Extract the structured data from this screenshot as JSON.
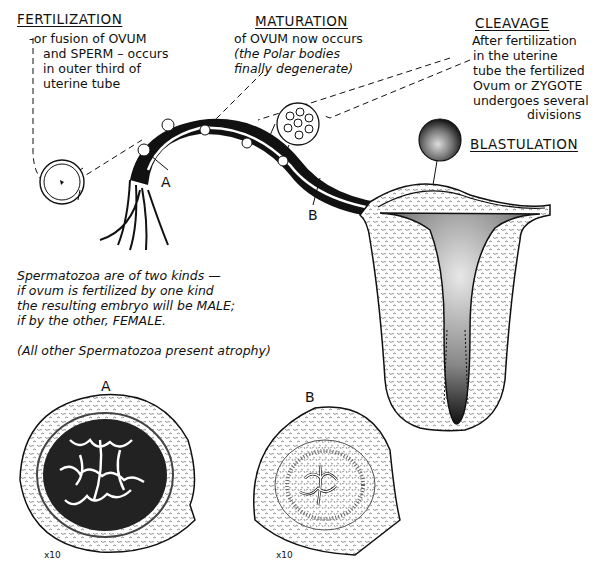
{
  "fertilization": {
    "heading": "FERTILIZATION",
    "lines": [
      "-or fusion of OVUM",
      "and SPERM – occurs",
      "in outer third of",
      "uterine tube"
    ]
  },
  "maturation": {
    "heading": "MATURATION",
    "lines": [
      "of OVUM now occurs"
    ],
    "italic_lines": [
      "(the Polar bodies",
      "finally degenerate)"
    ]
  },
  "cleavage": {
    "heading": "CLEAVAGE",
    "lines": [
      "After fertilization",
      "in the uterine",
      "tube the fertilized",
      "Ovum or ZYGOTE",
      "undergoes several",
      "divisions"
    ]
  },
  "blastulation": {
    "heading": "BLASTULATION"
  },
  "spermatozoa_note": {
    "lines": [
      "Spermatozoa are of two kinds —",
      "if ovum is fertilized by one kind",
      "the resulting embryo will be MALE;",
      "if by the other, FEMALE."
    ],
    "footnote": "(All other Spermatozoa present atrophy)"
  },
  "tube_markers": {
    "a": "A",
    "b": "B"
  },
  "sections": [
    {
      "label": "A",
      "magnification": "x10"
    },
    {
      "label": "B",
      "magnification": "x10"
    }
  ],
  "colors": {
    "ink": "#111111",
    "paper": "#ffffff",
    "stipple": "#9a9a9a"
  }
}
